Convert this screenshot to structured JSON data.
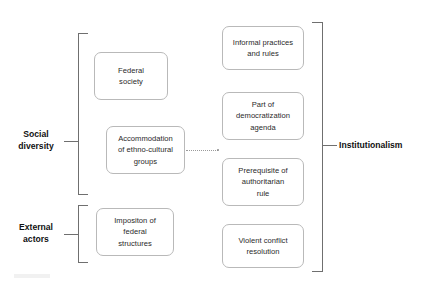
{
  "diagram": {
    "title": "Institutionalism",
    "accent_color": "#6f6f6f",
    "node_border_color": "#b9b9b9",
    "text_color": "#2a2a2a",
    "categories": [
      {
        "id": "social-diversity",
        "label": "Social\ndiversity"
      },
      {
        "id": "external-actors",
        "label": "External\nactors"
      }
    ],
    "cause_nodes": [
      {
        "id": "federal-society",
        "label": "Federal\nsociety",
        "category": "social-diversity"
      },
      {
        "id": "accommodation",
        "label": "Accommodation\nof ethno-cultural\ngroups",
        "category": "social-diversity"
      },
      {
        "id": "imposition",
        "label": "Impositon of\nfederal\nstructures",
        "category": "external-actors"
      }
    ],
    "effect_nodes": [
      {
        "id": "informal-practices",
        "label": "Informal practices\nand rules"
      },
      {
        "id": "democratization",
        "label": "Part of\ndemocratization\nagenda"
      },
      {
        "id": "authoritarian-rule",
        "label": "Prerequisite of\nauthoritarian\nrule"
      },
      {
        "id": "violent-conflict",
        "label": "Violent conflict\nresolution"
      }
    ],
    "outcome": {
      "id": "institutionalism",
      "label": "Institutionalism"
    },
    "connectors": [
      {
        "id": "accommodation-to-effects",
        "style": "dotted",
        "from": "accommodation",
        "to": "effect-group"
      }
    ]
  }
}
